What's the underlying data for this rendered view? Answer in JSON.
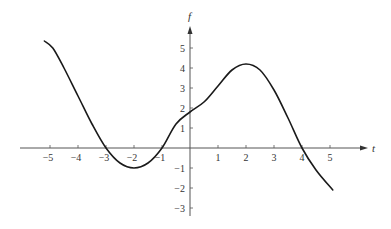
{
  "chart_data": {
    "type": "line",
    "title": "",
    "xlabel": "t",
    "ylabel": "f",
    "xlim": [
      -5.5,
      6.2
    ],
    "ylim": [
      -3.4,
      6.0
    ],
    "grid": false,
    "legend": null,
    "x_ticks": [
      -5,
      -4,
      -3,
      -2,
      -1,
      1,
      2,
      3,
      4,
      5
    ],
    "x_tick_labels": [
      "−5",
      "−4",
      "−3",
      "−2",
      "−1",
      "1",
      "2",
      "3",
      "4",
      "5"
    ],
    "y_ticks": [
      5,
      4,
      3,
      2,
      1,
      -1,
      -2,
      -3
    ],
    "y_tick_labels": [
      "5",
      "4",
      "3",
      "2",
      "1",
      "−1",
      "−2",
      "−3"
    ],
    "series": [
      {
        "name": "f(t)",
        "color": "#1a1a1a",
        "x": [
          -5.2,
          -4.9,
          -4.5,
          -4.0,
          -3.5,
          -3.0,
          -2.5,
          -2.0,
          -1.5,
          -1.0,
          -0.5,
          0.0,
          0.5,
          1.0,
          1.5,
          2.0,
          2.5,
          3.0,
          3.5,
          4.0,
          4.5,
          5.1
        ],
        "values": [
          5.35,
          5.0,
          4.0,
          2.6,
          1.2,
          0.0,
          -0.75,
          -1.0,
          -0.75,
          0.0,
          1.2,
          1.8,
          2.3,
          3.1,
          3.9,
          4.2,
          3.9,
          2.9,
          1.5,
          0.0,
          -1.1,
          -2.1
        ]
      }
    ],
    "key_points": {
      "zeros": [
        -3,
        -1,
        4
      ],
      "local_min": {
        "t": -2,
        "f": -1
      },
      "local_max": {
        "t": 2,
        "f": 4.2
      },
      "y_intercept": {
        "t": 0,
        "f": 1.8
      }
    }
  },
  "axes": {
    "x_label": "t",
    "y_label": "f"
  }
}
